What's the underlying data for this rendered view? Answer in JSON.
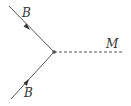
{
  "diagram": {
    "type": "feynman-vertex",
    "colors": {
      "line": "#555555",
      "text": "#333333",
      "background": "#ffffff"
    },
    "vertex": {
      "x": 54,
      "y": 52
    },
    "lines": [
      {
        "id": "incoming-top",
        "style": "solid",
        "from": [
          9,
          6
        ],
        "to": [
          54,
          52
        ],
        "arrow": "toward-vertex",
        "label": "B"
      },
      {
        "id": "incoming-bottom",
        "style": "solid",
        "from": [
          11,
          99
        ],
        "to": [
          54,
          52
        ],
        "arrow": "toward-vertex",
        "label": "B"
      },
      {
        "id": "outgoing-right",
        "style": "dashed",
        "from": [
          54,
          52
        ],
        "to": [
          124,
          52
        ],
        "arrow": "none",
        "label": "M"
      }
    ],
    "labels": {
      "top": "B",
      "bottom": "B",
      "right": "M"
    }
  }
}
